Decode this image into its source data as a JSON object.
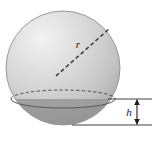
{
  "figure": {
    "kind": "geometry-diagram",
    "labels": {
      "radius": "r",
      "cap_height": "h"
    },
    "colors": {
      "sphere_highlight": "#ececec",
      "sphere_mid": "#d2d2d2",
      "sphere_shadow": "#b4b4b4",
      "cap_fill": "#a6a6a6",
      "cap_shadow": "#9a9a9a",
      "outline": "#6e6e6e",
      "dimension_line": "#2a2a2a",
      "background": "#ffffff"
    },
    "geometry": {
      "sphere_center_x": 63,
      "sphere_center_y": 68,
      "sphere_radius_px": 57,
      "cut_plane_y": 99,
      "cut_ellipse_rx": 52,
      "cut_ellipse_ry": 9,
      "sphere_bottom_y": 125,
      "cap_height_px": 26
    },
    "elements": {
      "radius_line_style": "dashed",
      "back_rim_style": "dashed",
      "front_rim_style": "solid",
      "dimension_arrow": "double-headed-vertical",
      "upper_extension_line_y": 99,
      "lower_extension_line_y": 125,
      "extension_line_x_start": 108,
      "extension_line_x_end": 152,
      "arrow_x": 137
    }
  }
}
